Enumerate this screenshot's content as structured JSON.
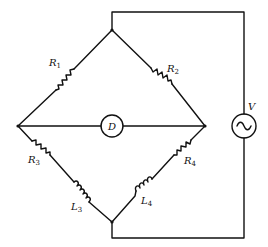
{
  "diagram": {
    "type": "AC bridge circuit",
    "colors": {
      "line": "#111111",
      "background": "#ffffff"
    },
    "components": {
      "R1": {
        "symbol": "R",
        "sub": "1",
        "kind": "resistor",
        "arm": "top-left"
      },
      "R2": {
        "symbol": "R",
        "sub": "2",
        "kind": "resistor",
        "arm": "top-right"
      },
      "R3": {
        "symbol": "R",
        "sub": "3",
        "kind": "resistor",
        "arm": "bottom-left"
      },
      "L3": {
        "symbol": "L",
        "sub": "3",
        "kind": "inductor",
        "arm": "bottom-left"
      },
      "R4": {
        "symbol": "R",
        "sub": "4",
        "kind": "resistor",
        "arm": "bottom-right"
      },
      "L4": {
        "symbol": "L",
        "sub": "4",
        "kind": "inductor",
        "arm": "bottom-right"
      },
      "D": {
        "symbol": "D",
        "kind": "detector",
        "position": "center"
      },
      "V": {
        "symbol": "V",
        "kind": "ac-source",
        "glyph": "~"
      }
    }
  }
}
